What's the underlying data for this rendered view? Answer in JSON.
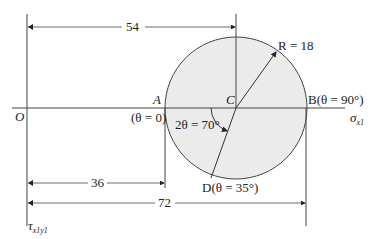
{
  "diagram": {
    "origin_label": "O",
    "center_label": "C",
    "point_a": {
      "name": "A",
      "theta": "(θ = 0)"
    },
    "point_b": {
      "name": "B",
      "theta": "(θ = 90°)",
      "full": "B(θ = 90°)"
    },
    "point_d": {
      "full": "D(θ = 35°)"
    },
    "radius_label": "R = 18",
    "angle_label": "2θ = 70°",
    "x_axis_label": "σ",
    "x_axis_sub": "x1",
    "y_axis_label": "τ",
    "y_axis_sub": "x1y1",
    "dimensions": {
      "oc": "54",
      "oa": "36",
      "ob": "72"
    },
    "colors": {
      "circle_fill": "#ebebeb",
      "line": "#333333"
    }
  }
}
